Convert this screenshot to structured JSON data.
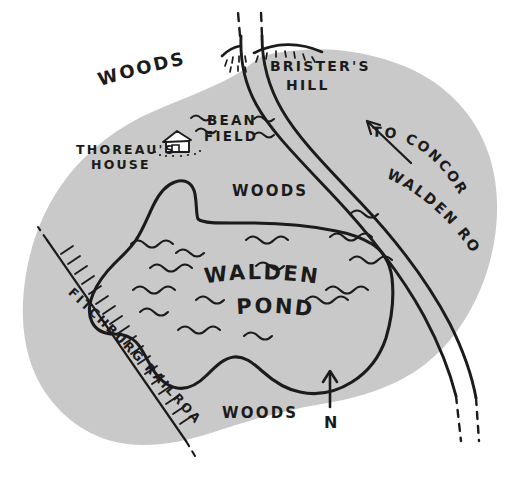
{
  "map": {
    "title": "Walden Pond hand-drawn sketch map",
    "colors": {
      "woods_fill": "#c9c9c9",
      "ink": "#1b1b1b",
      "paper": "#ffffff"
    },
    "labels": {
      "woods_upper": "WOODS",
      "woods_middle": "WOODS",
      "woods_lower": "WOODS",
      "thoreaus_house_line1": "THOREAU'S",
      "thoreaus_house_line2": "HOUSE",
      "bean_field_line1": "BEAN",
      "bean_field_line2": "FIELD",
      "bristers_hill_line1": "BRISTER'S",
      "bristers_hill_line2": "HILL",
      "walden_pond_line1": "WALDEN",
      "walden_pond_line2": "POND",
      "walden_road": "WALDEN ROAD",
      "to_concord": "TO CONCORD",
      "fitchburg_railroad": "FITCHBURG RAILROAD",
      "north": "N"
    },
    "features": [
      {
        "name": "woods-region",
        "kind": "area",
        "label": "WOODS"
      },
      {
        "name": "walden-pond",
        "kind": "water",
        "label": "WALDEN POND"
      },
      {
        "name": "walden-road",
        "kind": "road",
        "label": "WALDEN ROAD"
      },
      {
        "name": "fitchburg-railroad",
        "kind": "railway",
        "label": "FITCHBURG RAILROAD"
      },
      {
        "name": "bristers-hill",
        "kind": "hill",
        "label": "BRISTER'S HILL"
      },
      {
        "name": "bean-field",
        "kind": "field",
        "label": "BEAN FIELD"
      },
      {
        "name": "thoreaus-house",
        "kind": "building",
        "label": "THOREAU'S HOUSE"
      },
      {
        "name": "north-arrow",
        "kind": "compass",
        "label": "N"
      },
      {
        "name": "to-concord-arrow",
        "kind": "direction",
        "label": "TO CONCORD"
      }
    ]
  }
}
